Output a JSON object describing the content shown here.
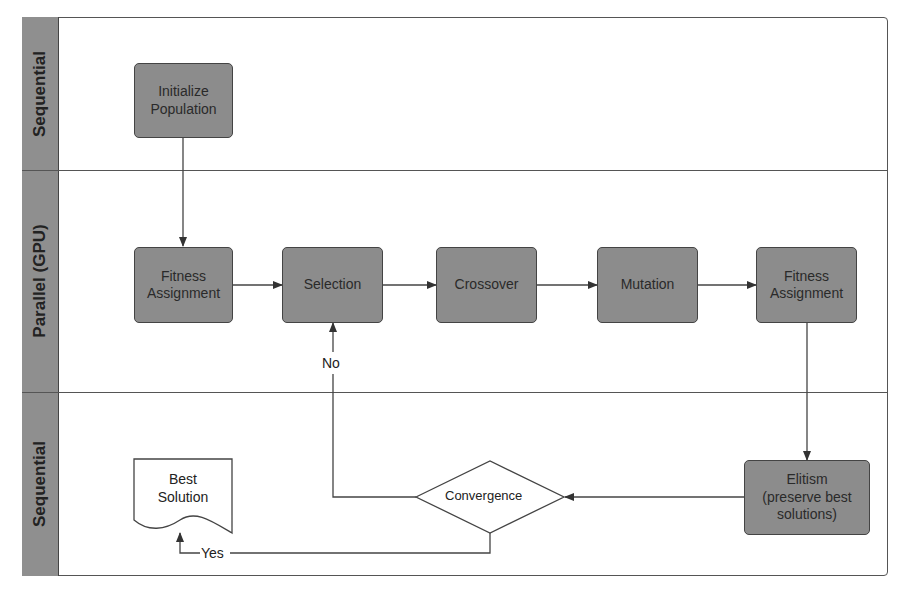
{
  "lanes": [
    {
      "label": "Sequential"
    },
    {
      "label": "Parallel (GPU)"
    },
    {
      "label": "Sequential"
    }
  ],
  "nodes": {
    "initialize": {
      "line1": "Initialize",
      "line2": "Population"
    },
    "fitness1": {
      "line1": "Fitness",
      "line2": "Assignment"
    },
    "selection": {
      "label": "Selection"
    },
    "crossover": {
      "label": "Crossover"
    },
    "mutation": {
      "label": "Mutation"
    },
    "fitness2": {
      "line1": "Fitness",
      "line2": "Assignment"
    },
    "elitism": {
      "line1": "Elitism",
      "line2": "(preserve best",
      "line3": "solutions)"
    },
    "convergence": {
      "label": "Convergence"
    },
    "best_solution": {
      "line1": "Best",
      "line2": "Solution"
    }
  },
  "edge_labels": {
    "no": "No",
    "yes": "Yes"
  },
  "colors": {
    "node_fill": "#8c8c8c",
    "lane_header": "#8f8f8f",
    "line": "#444444"
  }
}
